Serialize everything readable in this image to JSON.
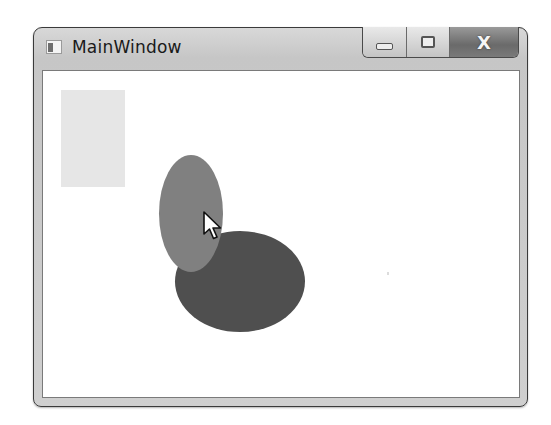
{
  "window": {
    "title": "MainWindow",
    "icon": "app-window-icon",
    "caption_buttons": [
      {
        "name": "minimize",
        "icon": "minimize-icon"
      },
      {
        "name": "maximize",
        "icon": "maximize-icon",
        "glyph": "▭"
      },
      {
        "name": "close",
        "icon": "close-icon",
        "glyph": "X"
      }
    ]
  },
  "canvas": {
    "shapes": [
      {
        "type": "rectangle",
        "fill": "#e6e6e6"
      },
      {
        "type": "ellipse",
        "label": "light-ellipse",
        "fill": "#808080"
      },
      {
        "type": "ellipse",
        "label": "dark-ellipse",
        "fill": "#4f4f4f"
      }
    ],
    "cursor": "arrow-pointer"
  },
  "colors": {
    "frame": "#cfcfcf",
    "client_bg": "#ffffff",
    "border": "#3a3a3a"
  }
}
